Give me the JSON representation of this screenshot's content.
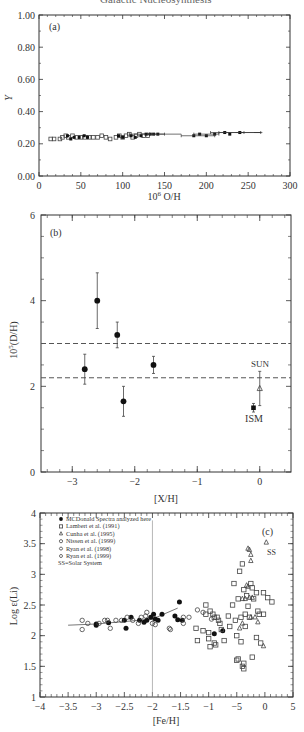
{
  "figure": {
    "cropped_caption": "Galactic Nucleosynthesis"
  },
  "chart_data": [
    {
      "panel": "(a)",
      "type": "scatter",
      "title": "",
      "xlabel": "10^6 O/H",
      "ylabel": "Y",
      "xlim": [
        0,
        300
      ],
      "ylim": [
        0.0,
        1.0
      ],
      "xticks": [
        "0",
        "50",
        "100",
        "150",
        "200",
        "250",
        "300"
      ],
      "yticks": [
        "0.00",
        "0.20",
        "0.40",
        "0.60",
        "0.80",
        "1.00"
      ],
      "grid": false,
      "series": [
        {
          "name": "open",
          "marker": "open-square",
          "points": [
            [
              14,
              0.23
            ],
            [
              18,
              0.23
            ],
            [
              25,
              0.23
            ],
            [
              28,
              0.24
            ],
            [
              32,
              0.25
            ],
            [
              35,
              0.24
            ],
            [
              40,
              0.25
            ],
            [
              45,
              0.24
            ],
            [
              50,
              0.24
            ],
            [
              55,
              0.24
            ],
            [
              60,
              0.24
            ],
            [
              65,
              0.24
            ],
            [
              70,
              0.24
            ],
            [
              75,
              0.25
            ],
            [
              80,
              0.24
            ],
            [
              85,
              0.23
            ],
            [
              92,
              0.24
            ],
            [
              96,
              0.25
            ],
            [
              100,
              0.24
            ],
            [
              104,
              0.25
            ],
            [
              108,
              0.26
            ],
            [
              112,
              0.24
            ],
            [
              116,
              0.25
            ],
            [
              120,
              0.26
            ],
            [
              125,
              0.25
            ],
            [
              130,
              0.25
            ]
          ]
        },
        {
          "name": "filled",
          "marker": "filled-square",
          "points": [
            [
              34,
              0.25
            ],
            [
              38,
              0.23
            ],
            [
              42,
              0.24
            ],
            [
              48,
              0.24
            ],
            [
              54,
              0.25
            ],
            [
              58,
              0.24
            ],
            [
              95,
              0.25
            ],
            [
              100,
              0.24
            ],
            [
              110,
              0.25
            ],
            [
              115,
              0.24
            ],
            [
              122,
              0.25
            ],
            [
              128,
              0.26
            ],
            [
              133,
              0.26
            ],
            [
              137,
              0.26
            ],
            [
              142,
              0.26
            ],
            [
              185,
              0.25
            ],
            [
              192,
              0.26
            ],
            [
              200,
              0.25
            ],
            [
              210,
              0.26
            ],
            [
              222,
              0.27
            ],
            [
              228,
              0.26
            ],
            [
              240,
              0.27
            ]
          ]
        },
        {
          "name": "errorbars",
          "marker": "hbar",
          "points": [
            [
              120,
              0.26,
              12
            ],
            [
              140,
              0.26,
              10
            ],
            [
              190,
              0.25,
              20
            ],
            [
              200,
              0.26,
              15
            ],
            [
              225,
              0.27,
              20
            ],
            [
              240,
              0.27,
              25
            ]
          ]
        }
      ]
    },
    {
      "panel": "(b)",
      "type": "scatter",
      "xlabel": "[X/H]",
      "ylabel": "10^5(D/H)",
      "xlim": [
        -3.5,
        0.5
      ],
      "ylim": [
        0,
        6
      ],
      "xticks": [
        "-3",
        "-2",
        "-1",
        "0"
      ],
      "yticks": [
        "0",
        "2",
        "4",
        "6"
      ],
      "grid": false,
      "points": [
        {
          "x": -2.8,
          "y": 2.4,
          "err": 0.35
        },
        {
          "x": -2.6,
          "y": 4.0,
          "err": 0.65
        },
        {
          "x": -2.28,
          "y": 3.2,
          "err": 0.3
        },
        {
          "x": -2.18,
          "y": 1.65,
          "err": 0.35
        },
        {
          "x": -1.7,
          "y": 2.5,
          "err": 0.2
        }
      ],
      "ism": {
        "x": -0.1,
        "y": 1.5,
        "err": 0.1,
        "label": "ISM"
      },
      "sun": {
        "x": 0.0,
        "y": 1.95,
        "err": 0.4,
        "label": "SUN",
        "marker": "open-triangle"
      },
      "hlines": [
        3.0,
        2.2
      ],
      "hline_style": "dashed"
    },
    {
      "panel": "(c)",
      "type": "scatter",
      "xlabel": "[Fe/H]",
      "ylabel": "Log ε(Li)",
      "xlim_ticks": [
        "-4",
        "-3.5",
        "-3",
        "-2.5",
        "-2",
        "-1.5",
        "-1",
        "-5",
        "0",
        "5"
      ],
      "ylim": [
        1,
        4
      ],
      "yticks": [
        "1",
        "1.5",
        "2",
        "2.5",
        "3",
        "3.5",
        "4"
      ],
      "vline_at_tick": "-2",
      "fit_line": [
        [
          -3.5,
          2.17
        ],
        [
          -3.0,
          2.19
        ],
        [
          -2.0,
          2.27
        ],
        [
          -1.55,
          2.45
        ]
      ],
      "legend": {
        "position": "upper-left",
        "entries": [
          {
            "marker": "filled-circle",
            "label": "MCDonald Spectra analyzed here"
          },
          {
            "marker": "open-square",
            "label": "Lambert et al. (1991)"
          },
          {
            "marker": "open-triangle",
            "label": "Cunha et al. (1995)"
          },
          {
            "marker": "open-circle",
            "label": "Nissen et al. (1999)"
          },
          {
            "marker": "open-hexagon",
            "label": "Ryan et al. (1998)"
          },
          {
            "marker": "open-hexagon",
            "label": "Ryan et al. (1999)"
          },
          {
            "marker": "none",
            "label": "SS=Solar System"
          }
        ]
      },
      "annotations": [
        {
          "text": "(c)",
          "pos": "upper-right"
        },
        {
          "text": "SS",
          "x_tick_pos": 8.1,
          "y": 3.3
        }
      ],
      "series": [
        {
          "name": "McDonald",
          "marker": "filled-circle",
          "points": [
            [
              -3.0,
              2.19
            ],
            [
              -3.0,
              2.17
            ],
            [
              -2.78,
              2.21
            ],
            [
              -2.5,
              2.25
            ],
            [
              -2.47,
              2.12
            ],
            [
              -2.38,
              2.3
            ],
            [
              -2.23,
              2.25
            ],
            [
              -2.15,
              2.22
            ],
            [
              -2.1,
              2.25
            ],
            [
              -2.03,
              2.3
            ],
            [
              -1.98,
              2.35
            ],
            [
              -1.95,
              2.27
            ],
            [
              -1.9,
              2.25
            ],
            [
              -1.83,
              2.35
            ],
            [
              -1.6,
              2.32
            ],
            [
              -1.55,
              2.26
            ],
            [
              -1.52,
              2.55
            ],
            [
              -1.47,
              2.25
            ],
            [
              -0.9,
              2.03
            ],
            [
              -0.75,
              2.08
            ]
          ]
        },
        {
          "name": "Nissen/Ryan",
          "marker": "open-circle",
          "points": [
            [
              -3.25,
              2.25
            ],
            [
              -3.25,
              2.1
            ],
            [
              -3.15,
              2.2
            ],
            [
              -2.95,
              2.2
            ],
            [
              -2.85,
              2.25
            ],
            [
              -2.8,
              2.25
            ],
            [
              -2.75,
              2.12
            ],
            [
              -2.65,
              2.25
            ],
            [
              -2.55,
              2.25
            ],
            [
              -2.45,
              2.3
            ],
            [
              -2.35,
              2.25
            ],
            [
              -2.25,
              2.2
            ],
            [
              -2.2,
              2.3
            ],
            [
              -2.12,
              2.32
            ],
            [
              -2.1,
              2.38
            ],
            [
              -2.0,
              2.2
            ],
            [
              -1.95,
              2.18
            ],
            [
              -1.7,
              2.12
            ],
            [
              -1.68,
              2.1
            ],
            [
              -1.45,
              2.3
            ],
            [
              -1.45,
              2.2
            ],
            [
              -1.35,
              2.3
            ],
            [
              -1.2,
              2.42
            ],
            [
              -1.1,
              2.38
            ],
            [
              -0.95,
              2.27
            ]
          ]
        },
        {
          "name": "Lambert",
          "marker": "open-square",
          "x_tick_pos_note": "x given in tick-index units from -4 (0) to 5 (9)",
          "points": [
            [
              5.9,
              2.35
            ],
            [
              5.9,
              2.5
            ],
            [
              6.05,
              2.4
            ],
            [
              6.15,
              2.35
            ],
            [
              6.2,
              2.3
            ],
            [
              6.3,
              2.3
            ],
            [
              6.35,
              2.25
            ],
            [
              6.0,
              2.05
            ],
            [
              6.0,
              1.95
            ],
            [
              6.05,
              1.82
            ],
            [
              6.2,
              1.88
            ],
            [
              6.25,
              1.85
            ],
            [
              6.4,
              2.2
            ],
            [
              6.45,
              2.1
            ],
            [
              6.55,
              1.92
            ],
            [
              6.7,
              2.32
            ],
            [
              6.75,
              2.15
            ],
            [
              6.85,
              2.5
            ],
            [
              6.9,
              2.85
            ],
            [
              6.95,
              2.25
            ],
            [
              7.0,
              2.0
            ],
            [
              7.05,
              2.6
            ],
            [
              7.1,
              3.05
            ],
            [
              7.15,
              2.3
            ],
            [
              7.15,
              1.9
            ],
            [
              7.2,
              3.17
            ],
            [
              7.25,
              2.75
            ],
            [
              7.3,
              2.15
            ],
            [
              7.3,
              2.35
            ],
            [
              7.35,
              2.65
            ],
            [
              7.4,
              2.48
            ],
            [
              7.45,
              2.3
            ],
            [
              7.5,
              2.85
            ],
            [
              7.55,
              2.78
            ],
            [
              7.6,
              2.6
            ],
            [
              7.7,
              1.97
            ],
            [
              7.7,
              2.7
            ],
            [
              7.75,
              2.4
            ],
            [
              7.8,
              2.35
            ],
            [
              7.85,
              1.88
            ],
            [
              7.95,
              2.7
            ],
            [
              7.95,
              2.35
            ],
            [
              8.1,
              2.62
            ],
            [
              8.25,
              2.55
            ],
            [
              7.0,
              1.6
            ],
            [
              7.05,
              1.62
            ],
            [
              7.2,
              1.5
            ],
            [
              7.25,
              1.55
            ],
            [
              7.55,
              1.65
            ],
            [
              7.25,
              1.46
            ],
            [
              5.55,
              2.12
            ],
            [
              5.6,
              1.92
            ],
            [
              5.8,
              2.08
            ]
          ]
        },
        {
          "name": "Cunha",
          "marker": "open-triangle",
          "points": [
            [
              7.4,
              3.42
            ],
            [
              7.45,
              3.4
            ],
            [
              7.5,
              3.32
            ],
            [
              7.5,
              3.22
            ],
            [
              7.35,
              2.82
            ],
            [
              7.4,
              2.8
            ],
            [
              7.45,
              2.62
            ],
            [
              7.3,
              2.6
            ],
            [
              7.55,
              2.62
            ],
            [
              7.2,
              2.6
            ],
            [
              7.2,
              2.2
            ],
            [
              7.1,
              2.12
            ],
            [
              7.65,
              2.3
            ],
            [
              7.75,
              2.22
            ],
            [
              7.95,
              1.83
            ],
            [
              8.05,
              3.52
            ],
            [
              7.5,
              2.3
            ]
          ]
        }
      ]
    }
  ]
}
